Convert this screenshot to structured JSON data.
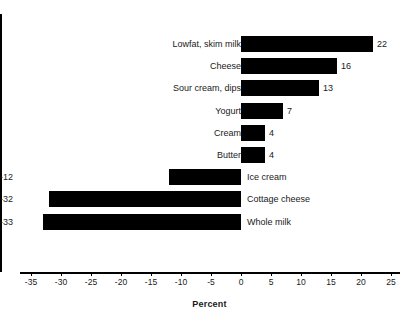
{
  "chart_data": {
    "type": "bar",
    "orientation": "horizontal",
    "title": "",
    "subtitle": "",
    "xlabel": "Percent",
    "ylabel": "",
    "xlim": [
      -35,
      25
    ],
    "grid": false,
    "legend": "none",
    "bar_color": "#000000",
    "axis_color": "#000000",
    "xticks": [
      -35,
      -30,
      -25,
      -20,
      -15,
      -10,
      -5,
      0,
      5,
      10,
      15,
      20,
      25
    ],
    "xtick_labels": [
      "-35",
      "-30",
      "-25",
      "-20",
      "-15",
      "-10",
      "-5",
      "0",
      "5",
      "10",
      "15",
      "20",
      "25"
    ],
    "categories": [
      "Lowfat, skim milk",
      "Cheese",
      "Sour cream, dips",
      "Yogurt",
      "Cream",
      "Butter",
      "Ice cream",
      "Cottage cheese",
      "Whole milk"
    ],
    "values": [
      22,
      16,
      13,
      7,
      4,
      4,
      -12,
      -32,
      -33
    ],
    "value_labels": [
      "22",
      "16",
      "13",
      "7",
      "4",
      "4",
      "-12",
      "-32",
      "-33"
    ],
    "bars": [
      {
        "label": "Lowfat, skim milk",
        "value": 22,
        "value_label": "22"
      },
      {
        "label": "Cheese",
        "value": 16,
        "value_label": "16"
      },
      {
        "label": "Sour cream, dips",
        "value": 13,
        "value_label": "13"
      },
      {
        "label": "Yogurt",
        "value": 7,
        "value_label": "7"
      },
      {
        "label": "Cream",
        "value": 4,
        "value_label": "4"
      },
      {
        "label": "Butter",
        "value": 4,
        "value_label": "4"
      },
      {
        "label": "Ice cream",
        "value": -12,
        "value_label": "-12"
      },
      {
        "label": "Cottage cheese",
        "value": -32,
        "value_label": "-32"
      },
      {
        "label": "Whole milk",
        "value": -33,
        "value_label": "-33"
      }
    ]
  },
  "layout": {
    "zero_x": 241,
    "px_per_unit": 6.0,
    "axis_left": 20,
    "axis_right": 400,
    "bar_top": 36,
    "bar_height": 16,
    "row_pitch": 22.2
  }
}
